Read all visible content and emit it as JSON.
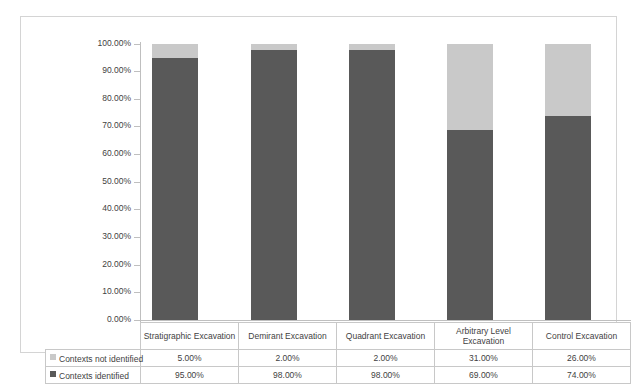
{
  "chart_data": {
    "type": "bar",
    "subtype": "stacked-column-100",
    "title": "",
    "xlabel": "",
    "ylabel": "",
    "ylim": [
      0,
      100
    ],
    "grid": false,
    "legend_position": "data-table",
    "categories": [
      "Stratigraphic Excavation",
      "Demirant Excavation",
      "Quadrant Excavation",
      "Arbitrary Level Excavation",
      "Control Excavation"
    ],
    "tick_labels": [
      "100.00%",
      "90.00%",
      "80.00%",
      "70.00%",
      "60.00%",
      "50.00%",
      "40.00%",
      "30.00%",
      "20.00%",
      "10.00%",
      "0.00%"
    ],
    "tick_values": [
      100,
      90,
      80,
      70,
      60,
      50,
      40,
      30,
      20,
      10,
      0
    ],
    "series": [
      {
        "name": "Contexts not identified",
        "color": "#c9c9c9",
        "values": [
          5.0,
          2.0,
          2.0,
          31.0,
          26.0
        ],
        "labels": [
          "5.00%",
          "2.00%",
          "2.00%",
          "31.00%",
          "26.00%"
        ]
      },
      {
        "name": "Contexts identified",
        "color": "#595959",
        "values": [
          95.0,
          98.0,
          98.0,
          69.0,
          74.0
        ],
        "labels": [
          "95.00%",
          "98.00%",
          "98.00%",
          "69.00%",
          "74.00%"
        ]
      }
    ]
  },
  "data_table": {
    "corner_label": "",
    "column_headers": [
      "Stratigraphic Excavation",
      "Demirant Excavation",
      "Quadrant Excavation",
      "Arbitrary Level Excavation",
      "Control Excavation"
    ],
    "rows": [
      {
        "label": "Contexts not identified",
        "swatch": "legend-swatch-light",
        "cells": [
          "5.00%",
          "2.00%",
          "2.00%",
          "31.00%",
          "26.00%"
        ]
      },
      {
        "label": "Contexts identified",
        "swatch": "legend-swatch-dark",
        "cells": [
          "95.00%",
          "98.00%",
          "98.00%",
          "69.00%",
          "74.00%"
        ]
      }
    ]
  },
  "colors": {
    "series_not_identified": "#c9c9c9",
    "series_identified": "#595959",
    "chart_border": "#d4d4d4",
    "axis_line": "#bfbfbf",
    "table_border": "#c8c8c8",
    "text": "#3f3f3f",
    "background": "#ffffff"
  }
}
